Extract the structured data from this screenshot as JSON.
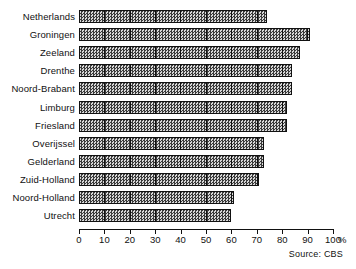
{
  "chart_data": {
    "type": "bar",
    "orientation": "horizontal",
    "title": "",
    "subtitle": "",
    "xlabel": "",
    "ylabel": "",
    "unit_label": "%",
    "xlim": [
      0,
      100
    ],
    "xticks": [
      0,
      10,
      20,
      30,
      40,
      50,
      60,
      70,
      80,
      90,
      100
    ],
    "xtick_labels": [
      "0",
      "10",
      "20",
      "30",
      "40",
      "50",
      "60",
      "70",
      "80",
      "90",
      "100"
    ],
    "grid": false,
    "bar_internal_gridlines": true,
    "bar_gridline_interval": 10,
    "legend": null,
    "categories": [
      "Netherlands",
      "Groningen",
      "Zeeland",
      "Drenthe",
      "Noord-Brabant",
      "Limburg",
      "Friesland",
      "Overijssel",
      "Gelderland",
      "Zuid-Holland",
      "Noord-Holland",
      "Utrecht"
    ],
    "values": [
      74,
      91,
      87,
      84,
      84,
      82,
      82,
      73,
      73,
      71,
      61,
      60
    ],
    "annotations": [
      "Source: CBS"
    ],
    "colors": {
      "bar_fill": "#8f8f8f",
      "bar_pattern_dark": "#3a3a3a",
      "bar_pattern_light": "#d8d8d8",
      "bar_outline": "#111111",
      "axis": "#111111",
      "text": "#111111",
      "background": "#ffffff"
    }
  },
  "source": {
    "text": "Source: CBS"
  }
}
